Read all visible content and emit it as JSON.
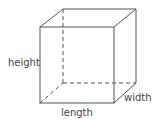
{
  "diagram": {
    "labels": {
      "height": "height",
      "length": "length",
      "width": "width"
    },
    "colors": {
      "stroke": "#555555",
      "text": "#444444"
    }
  }
}
